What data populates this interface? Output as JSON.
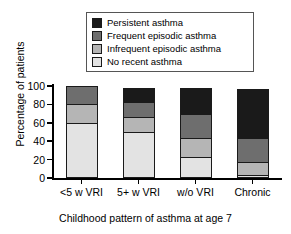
{
  "chart_data": {
    "type": "bar",
    "subtype": "stacked-bar-100",
    "title": "",
    "xlabel": "Childhood pattern of asthma at age 7",
    "ylabel": "Percentage of patients",
    "categories": [
      "<5 w VRI",
      "5+ w VRI",
      "w/o VRI",
      "Chronic"
    ],
    "yticks": [
      0,
      20,
      40,
      60,
      80,
      100
    ],
    "ylim": [
      0,
      100
    ],
    "grid": false,
    "legend_position": "top-center",
    "series": [
      {
        "name": "No recent asthma",
        "color": "#e3e3e3",
        "values": [
          60,
          50,
          23,
          3
        ]
      },
      {
        "name": "Infrequent episodic asthma",
        "color": "#b5b5b5",
        "values": [
          21,
          16,
          20,
          14
        ]
      },
      {
        "name": "Frequent episodic asthma",
        "color": "#6e6e6e",
        "values": [
          19,
          17,
          27,
          26
        ]
      },
      {
        "name": "Persistent asthma",
        "color": "#1a1a1a",
        "values": [
          0,
          15,
          28,
          54
        ]
      }
    ]
  },
  "legend": {
    "items": [
      {
        "label": "Persistent asthma",
        "color": "#1a1a1a"
      },
      {
        "label": "Frequent episodic asthma",
        "color": "#6e6e6e"
      },
      {
        "label": "Infrequent episodic asthma",
        "color": "#b5b5b5"
      },
      {
        "label": "No recent asthma",
        "color": "#e3e3e3"
      }
    ]
  },
  "axes": {
    "ylabel": "Percentage of patients",
    "xlabel": "Childhood pattern of asthma at age 7",
    "ytick_labels": [
      "100",
      "80",
      "60",
      "40",
      "20",
      "0"
    ],
    "xtick_labels": [
      "<5 w VRI",
      "5+ w VRI",
      "w/o VRI",
      "Chronic"
    ]
  }
}
